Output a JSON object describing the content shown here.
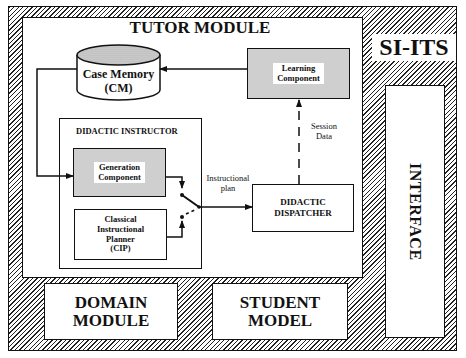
{
  "system_title": "SI-ITS",
  "tutor_module": {
    "title": "TUTOR MODULE",
    "case_memory": {
      "line1": "Case Memory",
      "line2": "(CM)"
    },
    "learning_component": {
      "line1": "Learning",
      "line2": "Component"
    },
    "didactic_instructor": {
      "title": "DIDACTIC INSTRUCTOR",
      "generation_component": {
        "line1": "Generation",
        "line2": "Component"
      },
      "cip": {
        "line1": "Classical",
        "line2": "Instructional",
        "line3": "Planner",
        "line4": "(CIP)"
      }
    },
    "didactic_dispatcher": {
      "line1": "DIDACTIC",
      "line2": "DISPATCHER"
    },
    "edge_labels": {
      "instructional_plan_1": "Instructional",
      "instructional_plan_2": "plan",
      "session_data_1": "Session",
      "session_data_2": "Data"
    }
  },
  "domain_module": {
    "line1": "DOMAIN",
    "line2": "MODULE"
  },
  "student_model": {
    "line1": "STUDENT",
    "line2": "MODEL"
  },
  "interface": {
    "label": "INTERFACE"
  },
  "colors": {
    "line": "#111111",
    "hatch": "#222222",
    "shaded": "#cfcfcf",
    "background": "#ffffff"
  }
}
